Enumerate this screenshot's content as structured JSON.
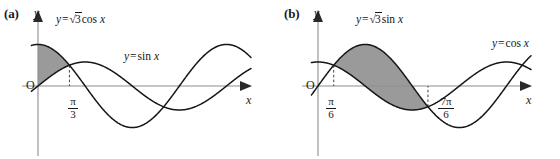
{
  "figure": {
    "width": 560,
    "height": 159,
    "background": "#ffffff",
    "curve_color": "#161616",
    "axis_color": "#8d8d8d",
    "shade_color": "#9a9a9a"
  },
  "panels": [
    {
      "id": "a",
      "label": "(a)",
      "y_axis_label": "y",
      "x_axis_label": "x",
      "origin_label": "O",
      "curve_labels": [
        {
          "name": "sqrt3-cos",
          "text_prefix": "y",
          "equals": "=",
          "radical": "√",
          "radicand": "3",
          "func": "cos",
          "var": "x"
        },
        {
          "name": "sin",
          "text_prefix": "y",
          "equals": "=",
          "radical": "",
          "radicand": "",
          "func": "sin",
          "var": "x"
        }
      ],
      "tick_labels": [
        {
          "name": "pi-over-3",
          "numerator": "π",
          "denominator": "3"
        }
      ],
      "shaded_region": {
        "upper_curve": "y = √3 cos x",
        "lower_curve": "y = sin x",
        "from": "0",
        "to": "π/3"
      }
    },
    {
      "id": "b",
      "label": "(b)",
      "y_axis_label": "y",
      "x_axis_label": "x",
      "origin_label": "O",
      "curve_labels": [
        {
          "name": "sqrt3-sin",
          "text_prefix": "y",
          "equals": "=",
          "radical": "√",
          "radicand": "3",
          "func": "sin",
          "var": "x"
        },
        {
          "name": "cos",
          "text_prefix": "y",
          "equals": "=",
          "radical": "",
          "radicand": "",
          "func": "cos",
          "var": "x"
        }
      ],
      "tick_labels": [
        {
          "name": "pi-over-6",
          "numerator": "π",
          "denominator": "6"
        },
        {
          "name": "seven-pi-over-6",
          "numerator": "7π",
          "denominator": "6"
        }
      ],
      "shaded_region": {
        "upper_curve": "y = √3 sin x",
        "lower_curve": "y = cos x",
        "from": "π/6",
        "to": "7π/6"
      }
    }
  ],
  "chart_data": [
    {
      "type": "line",
      "panel": "a",
      "title": "",
      "xlabel": "x",
      "ylabel": "y",
      "grid": false,
      "legend": "inline-curve-labels",
      "xlim": [
        -0.22,
        7.1
      ],
      "ylim": [
        -2.0,
        2.0
      ],
      "x_ticks": [
        {
          "value": 1.0471975512,
          "label": "π/3"
        }
      ],
      "series": [
        {
          "name": "y = √3 cos x",
          "amplitude": 1.7320508,
          "phase": "cos",
          "y_at_0": 1.7320508
        },
        {
          "name": "y = sin x",
          "amplitude": 1.0,
          "phase": "sin",
          "y_at_0": 0.0
        }
      ],
      "intersections": [
        {
          "x": 1.0471975512,
          "y": 0.8660254,
          "label": "π/3"
        }
      ],
      "shaded": {
        "between": [
          "y = √3 cos x",
          "y = sin x"
        ],
        "x_from": 0.0,
        "x_to": 1.0471975512,
        "color": "#9a9a9a"
      }
    },
    {
      "type": "line",
      "panel": "b",
      "title": "",
      "xlabel": "x",
      "ylabel": "y",
      "grid": false,
      "legend": "inline-curve-labels",
      "xlim": [
        -0.22,
        7.1
      ],
      "ylim": [
        -2.0,
        2.0
      ],
      "x_ticks": [
        {
          "value": 0.5235987756,
          "label": "π/6"
        },
        {
          "value": 3.6651914292,
          "label": "7π/6"
        }
      ],
      "series": [
        {
          "name": "y = √3 sin x",
          "amplitude": 1.7320508,
          "phase": "sin",
          "y_at_0": 0.0
        },
        {
          "name": "y = cos x",
          "amplitude": 1.0,
          "phase": "cos",
          "y_at_0": 1.0
        }
      ],
      "intersections": [
        {
          "x": 0.5235987756,
          "y": 0.8660254,
          "label": "π/6"
        },
        {
          "x": 3.6651914292,
          "y": -0.8660254,
          "label": "7π/6"
        }
      ],
      "shaded": {
        "between": [
          "y = √3 sin x",
          "y = cos x"
        ],
        "x_from": 0.5235987756,
        "x_to": 3.6651914292,
        "color": "#9a9a9a"
      }
    }
  ]
}
